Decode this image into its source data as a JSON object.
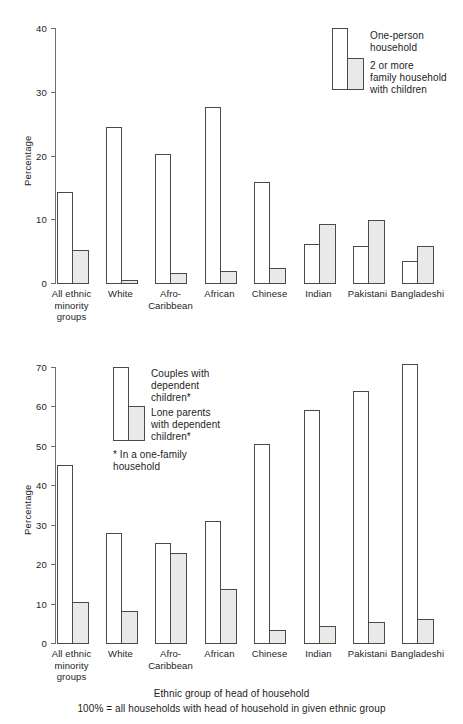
{
  "figure": {
    "axis_title": "Ethnic group of head of household",
    "base_note": "100% = all households with head of household in given ethnic group",
    "colors": {
      "open_bar_fill": "#ffffff",
      "solid_bar_fill": "#e9e9e9",
      "bar_stroke": "#4a4a4a",
      "axis": "#6e6e6e",
      "text": "#1d1d1d",
      "background": "#ffffff"
    }
  },
  "chart_data": [
    {
      "type": "bar",
      "id": "top",
      "title": "",
      "xlabel": "",
      "ylabel": "Percentage",
      "ylim": [
        0,
        40
      ],
      "yticks": [
        0,
        10,
        20,
        30,
        40
      ],
      "ytick_labels": [
        "0",
        "10",
        "20",
        "30",
        "40"
      ],
      "grid": false,
      "legend_position": "top-right",
      "categories": [
        "All ethnic\nminority\ngroups",
        "White",
        "Afro-\nCaribbean",
        "African",
        "Chinese",
        "Indian",
        "Pakistani",
        "Bangladeshi"
      ],
      "series": [
        {
          "name": "One-person\nhousehold",
          "style": "open",
          "values": [
            14.3,
            24.5,
            20.2,
            27.6,
            15.8,
            6.1,
            5.8,
            3.5
          ]
        },
        {
          "name": "2 or more\nfamily household\nwith children",
          "style": "solid",
          "values": [
            5.1,
            0.5,
            1.6,
            1.9,
            2.3,
            9.2,
            9.9,
            5.8
          ]
        }
      ]
    },
    {
      "type": "bar",
      "id": "bottom",
      "title": "",
      "xlabel": "Ethnic group of head of household",
      "ylabel": "Percentage",
      "ylim": [
        0,
        70
      ],
      "yticks": [
        0,
        10,
        20,
        30,
        40,
        50,
        60,
        70
      ],
      "ytick_labels": [
        "0",
        "10",
        "20",
        "30",
        "40",
        "50",
        "60",
        "70"
      ],
      "grid": false,
      "legend_position": "top-left",
      "legend_note": "* In a one-family\n   household",
      "categories": [
        "All ethnic\nminority\ngroups",
        "White",
        "Afro-\nCaribbean",
        "African",
        "Chinese",
        "Indian",
        "Pakistani",
        "Bangladeshi"
      ],
      "series": [
        {
          "name": "Couples with\ndependent\nchildren*",
          "style": "open",
          "values": [
            45.2,
            27.8,
            25.3,
            31.0,
            50.5,
            59.0,
            64.0,
            70.8
          ]
        },
        {
          "name": "Lone parents\nwith dependent\nchildren*",
          "style": "solid",
          "values": [
            10.5,
            8.0,
            22.8,
            13.8,
            3.3,
            4.2,
            5.4,
            6.1
          ]
        }
      ]
    }
  ]
}
